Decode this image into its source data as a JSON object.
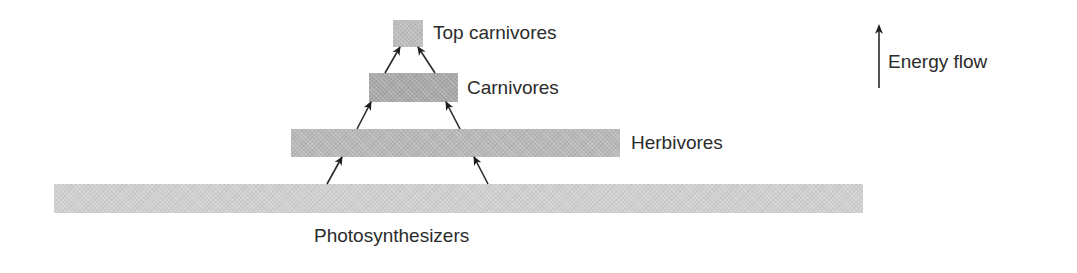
{
  "diagram": {
    "type": "trophic-pyramid",
    "levels": [
      {
        "id": "top-carnivores",
        "label": "Top carnivores",
        "x": 393,
        "y": 20,
        "w": 30,
        "h": 27,
        "color": "#bdbdbd"
      },
      {
        "id": "carnivores",
        "label": "Carnivores",
        "x": 369,
        "y": 73,
        "w": 89,
        "h": 29,
        "color": "#a9a9a9"
      },
      {
        "id": "herbivores",
        "label": "Herbivores",
        "x": 291,
        "y": 129,
        "w": 329,
        "h": 28,
        "color": "#b8b8b8"
      },
      {
        "id": "photosynthesizers",
        "label": "Photosynthesizers",
        "x": 54,
        "y": 184,
        "w": 809,
        "h": 29,
        "color": "#d0d0d0"
      }
    ],
    "labels": {
      "top_carnivores": "Top carnivores",
      "carnivores": "Carnivores",
      "herbivores": "Herbivores",
      "photosynthesizers": "Photosynthesizers"
    },
    "arrows": [
      {
        "from": "carnivores",
        "to": "top-carnivores",
        "x1": 385,
        "y1": 73,
        "x2": 400,
        "y2": 47
      },
      {
        "from": "carnivores",
        "to": "top-carnivores",
        "x1": 435,
        "y1": 73,
        "x2": 418,
        "y2": 47
      },
      {
        "from": "herbivores",
        "to": "carnivores",
        "x1": 357,
        "y1": 129,
        "x2": 371,
        "y2": 102
      },
      {
        "from": "herbivores",
        "to": "carnivores",
        "x1": 460,
        "y1": 129,
        "x2": 446,
        "y2": 102
      },
      {
        "from": "photosynthesizers",
        "to": "herbivores",
        "x1": 327,
        "y1": 184,
        "x2": 342,
        "y2": 157
      },
      {
        "from": "photosynthesizers",
        "to": "herbivores",
        "x1": 488,
        "y1": 184,
        "x2": 474,
        "y2": 157
      }
    ],
    "legend": {
      "label": "Energy flow",
      "icon": "up-arrow-icon"
    }
  }
}
